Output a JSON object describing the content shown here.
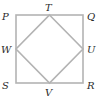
{
  "diagram": {
    "outer_square": {
      "vertices": [
        "P",
        "Q",
        "R",
        "S"
      ]
    },
    "inner_square": {
      "vertices": [
        "T",
        "U",
        "V",
        "W"
      ]
    },
    "labels": {
      "P": "P",
      "Q": "Q",
      "R": "R",
      "S": "S",
      "T": "T",
      "U": "U",
      "V": "V",
      "W": "W"
    },
    "colors": {
      "line": "#b3b3b3",
      "label": "#2a2a2a",
      "background": "#ffffff"
    }
  }
}
